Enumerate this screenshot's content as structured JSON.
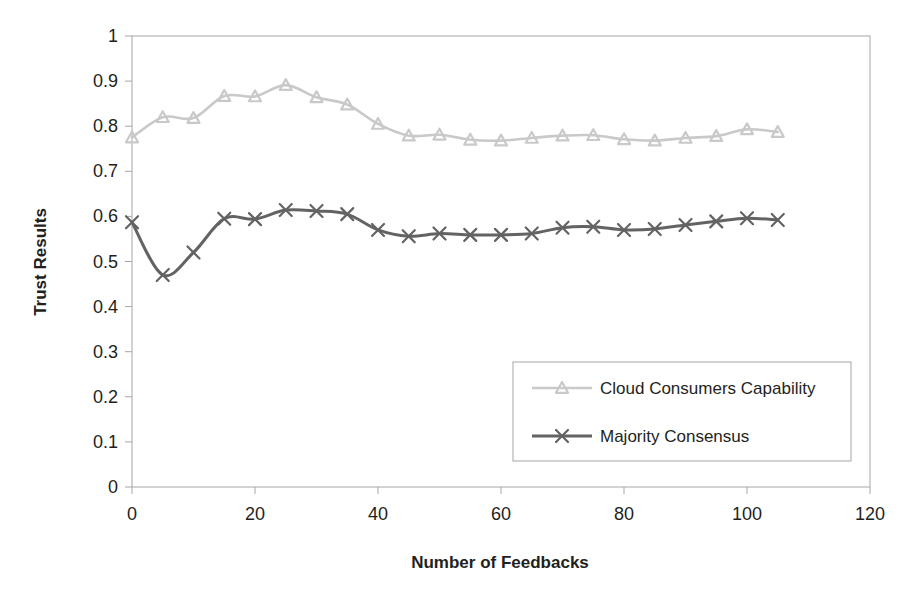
{
  "chart_data": {
    "type": "line",
    "title": "",
    "xlabel": "Number of Feedbacks",
    "ylabel": "Trust Results",
    "xlim": [
      0,
      120
    ],
    "ylim": [
      0,
      1
    ],
    "xticks": [
      "0",
      "20",
      "40",
      "60",
      "80",
      "100",
      "120"
    ],
    "xtick_values": [
      0,
      20,
      40,
      60,
      80,
      100,
      120
    ],
    "yticks": [
      "0",
      "0.1",
      "0.2",
      "0.3",
      "0.4",
      "0.5",
      "0.6",
      "0.7",
      "0.8",
      "0.9",
      "1"
    ],
    "ytick_values": [
      0,
      0.1,
      0.2,
      0.3,
      0.4,
      0.5,
      0.6,
      0.7,
      0.8,
      0.9,
      1
    ],
    "grid": false,
    "legend_position": "inside-lower-right",
    "x": [
      0,
      5,
      10,
      15,
      20,
      25,
      30,
      35,
      40,
      45,
      50,
      55,
      60,
      65,
      70,
      75,
      80,
      85,
      90,
      95,
      100,
      105
    ],
    "series": [
      {
        "name": "Cloud Consumers Capability",
        "color": "#c9c9c9",
        "marker": "triangle",
        "values": [
          0.775,
          0.82,
          0.818,
          0.867,
          0.866,
          0.891,
          0.864,
          0.848,
          0.805,
          0.779,
          0.781,
          0.77,
          0.768,
          0.774,
          0.779,
          0.78,
          0.771,
          0.768,
          0.774,
          0.778,
          0.793,
          0.787
        ]
      },
      {
        "name": "Majority Consensus",
        "color": "#636363",
        "marker": "x",
        "values": [
          0.587,
          0.47,
          0.52,
          0.595,
          0.594,
          0.614,
          0.612,
          0.605,
          0.57,
          0.556,
          0.562,
          0.559,
          0.559,
          0.562,
          0.575,
          0.577,
          0.57,
          0.572,
          0.581,
          0.589,
          0.596,
          0.592
        ]
      }
    ]
  },
  "legend": {
    "entries": [
      {
        "label": "Cloud Consumers Capability"
      },
      {
        "label": "Majority Consensus"
      }
    ]
  },
  "axes": {
    "x_title": "Number of Feedbacks",
    "y_title": "Trust Results"
  }
}
